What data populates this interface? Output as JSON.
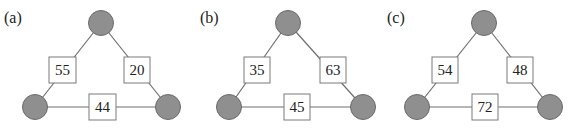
{
  "diagram": {
    "style": {
      "node_fill": "#8f8f8f",
      "edge_color": "#6e6e6e",
      "box_fill": "#ffffff"
    },
    "panels": [
      {
        "label": "(a)",
        "edges": {
          "left": "55",
          "right": "20",
          "bottom": "44"
        }
      },
      {
        "label": "(b)",
        "edges": {
          "left": "35",
          "right": "63",
          "bottom": "45"
        }
      },
      {
        "label": "(c)",
        "edges": {
          "left": "54",
          "right": "48",
          "bottom": "72"
        }
      }
    ]
  }
}
